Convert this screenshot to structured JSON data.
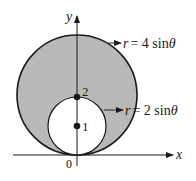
{
  "figure": {
    "axes": {
      "x_label": "x",
      "y_label": "y",
      "origin_label": "0"
    },
    "curves": [
      {
        "id": "outer",
        "label": "r = 4 sin θ",
        "label_r": "r",
        "label_eq": "= 4 sin",
        "label_theta": "θ",
        "center_y": 2,
        "radius": 2
      },
      {
        "id": "inner",
        "label": "r = 2 sin θ",
        "label_r": "r",
        "label_eq": "= 2 sin",
        "label_theta": "θ",
        "center_y": 1,
        "radius": 1
      }
    ],
    "points": [
      {
        "label": "2",
        "y": 2
      },
      {
        "label": "1",
        "y": 1
      }
    ],
    "colors": {
      "shaded_region": "#b9b9b9",
      "stroke": "#1a1a1a",
      "background": "#ffffff"
    }
  }
}
